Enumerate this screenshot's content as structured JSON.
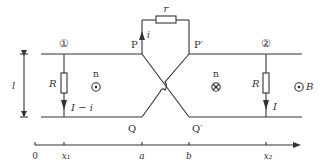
{
  "diagram": {
    "labels": {
      "node1": "①",
      "node2": "②",
      "P": "P",
      "P_prime": "P′",
      "Q": "Q",
      "Q_prime": "Q′",
      "r": "r",
      "i": "i",
      "R1": "R",
      "R2": "R",
      "I_minus_i": "I − i",
      "I": "I",
      "n_left": "n",
      "n_right": "n",
      "B": "B",
      "l": "l"
    },
    "axis": {
      "origin": "0",
      "ticks": [
        "x₁",
        "a",
        "b",
        "x₂"
      ]
    },
    "field": {
      "left_region": "out-of-page (⊙)",
      "middle_region": "into-page (⊗)",
      "right_region": "out-of-page (⊙)"
    },
    "colors": {
      "line": "#333333",
      "background": "#ffffff"
    }
  }
}
